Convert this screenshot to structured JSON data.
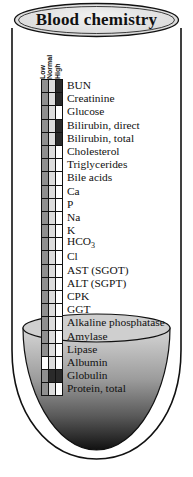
{
  "title": "Blood chemistry",
  "columns": [
    "Low",
    "Normal",
    "High"
  ],
  "colors": {
    "low_fill": "#8f8f8f",
    "normal_fill": "#dcdcdc",
    "high_fill": "#2a2a2a",
    "empty_fill": "#ffffff",
    "outline": "#111111",
    "banner_fill": "#e2e2e2"
  },
  "rows": [
    {
      "label": "BUN",
      "low": "grey",
      "normal": "grey",
      "high": "dark"
    },
    {
      "label": "Creatinine",
      "low": "grey",
      "normal": "grey",
      "high": "dark"
    },
    {
      "label": "Glucose",
      "low": "grey",
      "normal": "grey",
      "high": "white"
    },
    {
      "label": "Bilirubin, direct",
      "low": "grey",
      "normal": "grey",
      "high": "dark"
    },
    {
      "label": "Bilirubin, total",
      "low": "grey",
      "normal": "grey",
      "high": "dark"
    },
    {
      "label": "Cholesterol",
      "low": "grey",
      "normal": "grey",
      "high": "white"
    },
    {
      "label": "Triglycerides",
      "low": "grey",
      "normal": "grey",
      "high": "white"
    },
    {
      "label": "Bile acids",
      "low": "grey",
      "normal": "grey",
      "high": "white"
    },
    {
      "label": "Ca",
      "low": "grey",
      "normal": "grey",
      "high": "white"
    },
    {
      "label": "P",
      "low": "grey",
      "normal": "grey",
      "high": "white"
    },
    {
      "label": "Na",
      "low": "grey",
      "normal": "grey",
      "high": "white"
    },
    {
      "label": "K",
      "low": "grey",
      "normal": "grey",
      "high": "white"
    },
    {
      "label": "HCO3",
      "low": "grey",
      "normal": "grey",
      "high": "white"
    },
    {
      "label": "Cl",
      "low": "grey",
      "normal": "grey",
      "high": "white"
    },
    {
      "label": "AST (SGOT)",
      "low": "grey",
      "normal": "grey",
      "high": "white"
    },
    {
      "label": "ALT (SGPT)",
      "low": "grey",
      "normal": "grey",
      "high": "white"
    },
    {
      "label": "CPK",
      "low": "grey",
      "normal": "grey",
      "high": "white"
    },
    {
      "label": "GGT",
      "low": "grey",
      "normal": "grey",
      "high": "white"
    },
    {
      "label": "Alkaline phosphatase",
      "low": "grey",
      "normal": "grey",
      "high": "white"
    },
    {
      "label": "Amylase",
      "low": "grey",
      "normal": "grey",
      "high": "white"
    },
    {
      "label": "Lipase",
      "low": "grey",
      "normal": "grey",
      "high": "white"
    },
    {
      "label": "Albumin",
      "low": "white",
      "normal": "grey",
      "high": "white"
    },
    {
      "label": "Globulin",
      "low": "grey",
      "normal": "dark",
      "high": "dark"
    },
    {
      "label": "Protein, total",
      "low": "grey",
      "normal": "grey",
      "high": "white"
    }
  ]
}
